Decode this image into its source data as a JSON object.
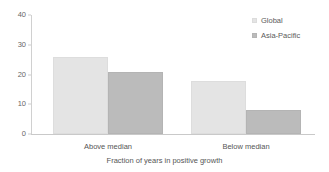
{
  "chart_data": {
    "type": "bar",
    "title": "",
    "subtitle": "",
    "xlabel": "Fraction of years in positive growth",
    "ylabel": "",
    "categories": [
      "Above median",
      "Below median"
    ],
    "series": [
      {
        "name": "Global",
        "color": "#e4e4e4",
        "values": [
          26,
          17.8
        ]
      },
      {
        "name": "Asia-Pacific",
        "color": "#bbbbbb",
        "values": [
          21,
          8
        ]
      }
    ],
    "ylim": [
      0,
      40
    ],
    "yticks": [
      "0",
      "10",
      "20",
      "30",
      "40"
    ],
    "ytick_values": [
      0,
      10,
      20,
      30,
      40
    ],
    "grid": false,
    "legend_position": "top-right",
    "orientation": "vertical",
    "grouping": "grouped"
  },
  "legend": {
    "entries": [
      {
        "label": "Global",
        "marker": "square-swatch-light"
      },
      {
        "label": "Asia-Pacific",
        "marker": "square-swatch-dark"
      }
    ]
  },
  "axes": {
    "x_axis_title": "Fraction of years in positive growth",
    "y_axis_title": ""
  }
}
